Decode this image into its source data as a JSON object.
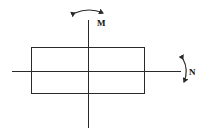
{
  "diagram": {
    "title": "",
    "labels": {
      "moment_top": "M",
      "moment_right": "N"
    },
    "colors": {
      "stroke": "#2a2a2a",
      "background": "#ffffff"
    },
    "elements": {
      "rectangle": {
        "x": 31,
        "y": 47,
        "width": 113,
        "height": 46
      },
      "horizontal_axis": {
        "x1": 12,
        "y1": 71,
        "x2": 181,
        "y2": 71
      },
      "vertical_axis": {
        "x1": 88,
        "y1": 20,
        "x2": 88,
        "y2": 128
      },
      "arc_arrow_top": {
        "description": "double-headed curved arrow about vertical axis"
      },
      "arc_arrow_right": {
        "description": "double-headed curved arrow about horizontal axis"
      }
    }
  }
}
